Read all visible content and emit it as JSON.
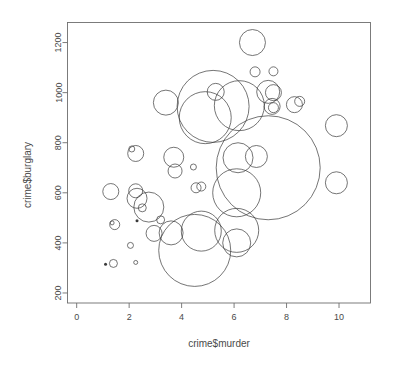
{
  "chart_data": {
    "type": "scatter",
    "title": "",
    "xlabel": "crime$murder",
    "ylabel": "crime$burglary",
    "xlim": [
      -0.35,
      11.2
    ],
    "ylim": [
      160,
      1280
    ],
    "xticks": [
      0,
      2,
      4,
      6,
      8,
      10
    ],
    "yticks": [
      200,
      400,
      600,
      800,
      1000,
      1200
    ],
    "xtick_labels": [
      "0",
      "2",
      "4",
      "6",
      "8",
      "10"
    ],
    "ytick_labels": [
      "200",
      "400",
      "600",
      "800",
      "1000",
      "1200"
    ],
    "grid": false,
    "legend": null,
    "marker": "open-circle",
    "size_encoding": "bubble radius proportional to a third variable",
    "points": [
      {
        "x": 6.7,
        "y": 1200,
        "r": 13.0
      },
      {
        "x": 5.3,
        "y": 1003,
        "r": 8.5
      },
      {
        "x": 6.8,
        "y": 1083,
        "r": 5.0
      },
      {
        "x": 7.5,
        "y": 1085,
        "r": 4.5
      },
      {
        "x": 5.2,
        "y": 945,
        "r": 36.0
      },
      {
        "x": 3.4,
        "y": 960,
        "r": 12.5
      },
      {
        "x": 7.3,
        "y": 1003,
        "r": 11.5
      },
      {
        "x": 7.5,
        "y": 1000,
        "r": 8.0
      },
      {
        "x": 4.9,
        "y": 900,
        "r": 26.0
      },
      {
        "x": 6.2,
        "y": 948,
        "r": 25.0
      },
      {
        "x": 7.45,
        "y": 945,
        "r": 8.0
      },
      {
        "x": 7.5,
        "y": 940,
        "r": 5.0
      },
      {
        "x": 8.3,
        "y": 952,
        "r": 8.0
      },
      {
        "x": 8.5,
        "y": 965,
        "r": 5.0
      },
      {
        "x": 9.9,
        "y": 868,
        "r": 11.0
      },
      {
        "x": 7.3,
        "y": 700,
        "r": 52.0
      },
      {
        "x": 2.1,
        "y": 775,
        "r": 3.0
      },
      {
        "x": 2.25,
        "y": 757,
        "r": 8.0
      },
      {
        "x": 3.7,
        "y": 742,
        "r": 10.0
      },
      {
        "x": 3.75,
        "y": 687,
        "r": 7.0
      },
      {
        "x": 4.45,
        "y": 703,
        "r": 3.0
      },
      {
        "x": 6.15,
        "y": 740,
        "r": 15.0
      },
      {
        "x": 6.85,
        "y": 745,
        "r": 11.0
      },
      {
        "x": 1.3,
        "y": 605,
        "r": 8.0
      },
      {
        "x": 2.25,
        "y": 608,
        "r": 7.0
      },
      {
        "x": 2.3,
        "y": 578,
        "r": 10.0
      },
      {
        "x": 2.75,
        "y": 543,
        "r": 15.0
      },
      {
        "x": 2.5,
        "y": 540,
        "r": 4.0
      },
      {
        "x": 4.55,
        "y": 620,
        "r": 5.0
      },
      {
        "x": 4.75,
        "y": 625,
        "r": 4.5
      },
      {
        "x": 6.1,
        "y": 600,
        "r": 24.0
      },
      {
        "x": 9.9,
        "y": 640,
        "r": 11.0
      },
      {
        "x": 1.35,
        "y": 480,
        "r": 2.0
      },
      {
        "x": 1.45,
        "y": 473,
        "r": 5.0
      },
      {
        "x": 2.3,
        "y": 488,
        "r": 1.5
      },
      {
        "x": 3.2,
        "y": 492,
        "r": 4.0
      },
      {
        "x": 2.95,
        "y": 438,
        "r": 8.0
      },
      {
        "x": 3.6,
        "y": 440,
        "r": 12.0
      },
      {
        "x": 4.75,
        "y": 447,
        "r": 20.0
      },
      {
        "x": 6.1,
        "y": 450,
        "r": 22.0
      },
      {
        "x": 6.1,
        "y": 400,
        "r": 14.0
      },
      {
        "x": 4.5,
        "y": 370,
        "r": 36.0
      },
      {
        "x": 2.05,
        "y": 390,
        "r": 3.0
      },
      {
        "x": 1.1,
        "y": 315,
        "r": 1.5
      },
      {
        "x": 1.4,
        "y": 318,
        "r": 4.0
      },
      {
        "x": 2.25,
        "y": 322,
        "r": 2.0
      }
    ]
  }
}
